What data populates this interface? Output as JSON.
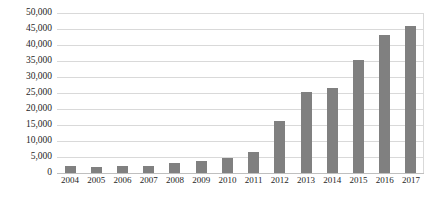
{
  "chart_data": {
    "type": "bar",
    "title": "",
    "subtitle": "",
    "xlabel": "",
    "ylabel": "",
    "categories": [
      "2004",
      "2005",
      "2006",
      "2007",
      "2008",
      "2009",
      "2010",
      "2011",
      "2012",
      "2013",
      "2014",
      "2015",
      "2016",
      "2017"
    ],
    "values": [
      2300,
      2000,
      2200,
      2200,
      3200,
      3800,
      4600,
      6600,
      16300,
      25200,
      26500,
      35300,
      43200,
      46000
    ],
    "series": [
      {
        "name": "",
        "values": [
          2300,
          2000,
          2200,
          2200,
          3200,
          3800,
          4600,
          6600,
          16300,
          25200,
          26500,
          35300,
          43200,
          46000
        ]
      }
    ],
    "ylim": [
      0,
      50000
    ],
    "ytick_labels": [
      "50,000",
      "45,000",
      "40,000",
      "35,000",
      "30,000",
      "25,000",
      "20,000",
      "15,000",
      "10,000",
      "5,000",
      "0"
    ],
    "ytick_values": [
      50000,
      45000,
      40000,
      35000,
      30000,
      25000,
      20000,
      15000,
      10000,
      5000,
      0
    ],
    "xtick_labels": [
      "2004",
      "2005",
      "2006",
      "2007",
      "2008",
      "2009",
      "2010",
      "2011",
      "2012",
      "2013",
      "2014",
      "2015",
      "2016",
      "2017"
    ],
    "grid": "horizontal",
    "legend": "none",
    "legend_position": "none",
    "annotations": [],
    "colors": {
      "bar": "#808080",
      "grid": "#d9d9d9",
      "axis": "#bfbfbf",
      "text": "#262626",
      "background": "#ffffff"
    }
  }
}
